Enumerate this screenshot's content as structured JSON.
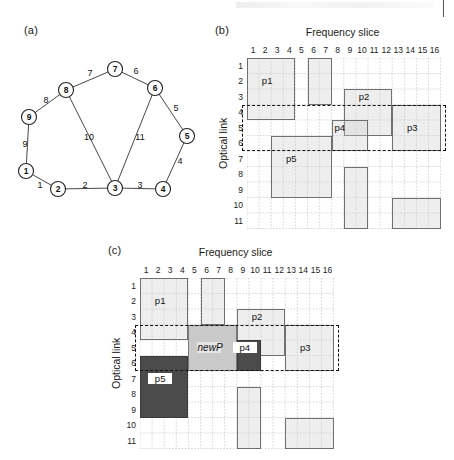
{
  "figure": {
    "panels": {
      "a": "(a)",
      "b": "(b)",
      "c": "(c)"
    },
    "axis": {
      "x_title": "Frequency slice",
      "y_title": "Optical link"
    },
    "columns": [
      "1",
      "2",
      "3",
      "4",
      "5",
      "6",
      "7",
      "8",
      "9",
      "10",
      "11",
      "12",
      "13",
      "14",
      "15",
      "16"
    ],
    "rows": [
      "1",
      "2",
      "3",
      "4",
      "5",
      "6",
      "7",
      "8",
      "9",
      "10",
      "11"
    ]
  },
  "topology": {
    "nodes": [
      {
        "id": "1",
        "label": "1",
        "x": 26,
        "y": 131
      },
      {
        "id": "2",
        "label": "2",
        "x": 58,
        "y": 149
      },
      {
        "id": "3",
        "label": "3",
        "x": 115,
        "y": 148
      },
      {
        "id": "4",
        "label": "4",
        "x": 163,
        "y": 149
      },
      {
        "id": "5",
        "label": "5",
        "x": 187,
        "y": 96
      },
      {
        "id": "6",
        "label": "6",
        "x": 155,
        "y": 48
      },
      {
        "id": "7",
        "label": "7",
        "x": 115,
        "y": 29
      },
      {
        "id": "8",
        "label": "8",
        "x": 66,
        "y": 50
      },
      {
        "id": "9",
        "label": "9",
        "x": 29,
        "y": 77
      }
    ],
    "links": [
      {
        "label": "1",
        "from": "1",
        "to": "2",
        "lx": 40,
        "ly": 146
      },
      {
        "label": "2",
        "from": "2",
        "to": "3",
        "lx": 85,
        "ly": 146
      },
      {
        "label": "3",
        "from": "3",
        "to": "4",
        "lx": 140,
        "ly": 146
      },
      {
        "label": "4",
        "from": "4",
        "to": "5",
        "lx": 180,
        "ly": 122
      },
      {
        "label": "5",
        "from": "5",
        "to": "6",
        "lx": 176,
        "ly": 69
      },
      {
        "label": "6",
        "from": "6",
        "to": "7",
        "lx": 136,
        "ly": 32
      },
      {
        "label": "7",
        "from": "7",
        "to": "8",
        "lx": 90,
        "ly": 34
      },
      {
        "label": "8",
        "from": "8",
        "to": "9",
        "lx": 46,
        "ly": 61
      },
      {
        "label": "9",
        "from": "9",
        "to": "1",
        "lx": 25,
        "ly": 105
      },
      {
        "label": "10",
        "from": "8",
        "to": "3",
        "lx": 89,
        "ly": 98
      },
      {
        "label": "11",
        "from": "6",
        "to": "3",
        "lx": 140,
        "ly": 98
      }
    ]
  },
  "chart_data": {
    "type": "heatmap",
    "xlabel": "Frequency slice",
    "ylabel": "Optical link",
    "x": [
      "1",
      "2",
      "3",
      "4",
      "5",
      "6",
      "7",
      "8",
      "9",
      "10",
      "11",
      "12",
      "13",
      "14",
      "15",
      "16"
    ],
    "y": [
      "1",
      "2",
      "3",
      "4",
      "5",
      "6",
      "7",
      "8",
      "9",
      "10",
      "11"
    ],
    "panels": [
      {
        "key": "b",
        "tag": "(b)",
        "caption": "Spectrum state before allocation",
        "blocks": [
          {
            "label": "p1",
            "col_start": 1,
            "col_end": 4,
            "row_start": 1,
            "row_end": 4,
            "shade": "light",
            "label_col": 2,
            "label_row": 2
          },
          {
            "label": "",
            "col_start": 6,
            "col_end": 7,
            "row_start": 1,
            "row_end": 3,
            "shade": "light",
            "label_col": 0,
            "label_row": 0
          },
          {
            "label": "p2",
            "col_start": 9,
            "col_end": 12,
            "row_start": 3,
            "row_end": 5,
            "shade": "light",
            "label_col": 10,
            "label_row": 3
          },
          {
            "label": "p3",
            "col_start": 13,
            "col_end": 16,
            "row_start": 4,
            "row_end": 6,
            "shade": "light",
            "label_col": 14,
            "label_row": 5
          },
          {
            "label": "p4",
            "col_start": 8,
            "col_end": 10,
            "row_start": 5,
            "row_end": 6,
            "shade": "light",
            "label_col": 8,
            "label_row": 5
          },
          {
            "label": "p5",
            "col_start": 3,
            "col_end": 7,
            "row_start": 6,
            "row_end": 9,
            "shade": "light",
            "label_col": 4,
            "label_row": 7
          },
          {
            "label": "",
            "col_start": 9,
            "col_end": 10,
            "row_start": 8,
            "row_end": 11,
            "shade": "light",
            "label_col": 0,
            "label_row": 0
          },
          {
            "label": "",
            "col_start": 13,
            "col_end": 16,
            "row_start": 10,
            "row_end": 11,
            "shade": "light",
            "label_col": 0,
            "label_row": 0
          }
        ],
        "dashed_region": {
          "row_start": 4,
          "row_end": 6,
          "col_start": 1,
          "col_end": 16
        }
      },
      {
        "key": "c",
        "tag": "(c)",
        "caption": "Spectrum state after allocating newP",
        "blocks": [
          {
            "label": "p1",
            "col_start": 1,
            "col_end": 4,
            "row_start": 1,
            "row_end": 4,
            "shade": "light",
            "label_col": 2,
            "label_row": 2
          },
          {
            "label": "",
            "col_start": 6,
            "col_end": 7,
            "row_start": 1,
            "row_end": 3,
            "shade": "light",
            "label_col": 0,
            "label_row": 0
          },
          {
            "label": "p2",
            "col_start": 9,
            "col_end": 12,
            "row_start": 3,
            "row_end": 5,
            "shade": "light",
            "label_col": 10,
            "label_row": 3
          },
          {
            "label": "p3",
            "col_start": 13,
            "col_end": 16,
            "row_start": 4,
            "row_end": 6,
            "shade": "light",
            "label_col": 14,
            "label_row": 5
          },
          {
            "label": "newP",
            "col_start": 5,
            "col_end": 8,
            "row_start": 4,
            "row_end": 6,
            "shade": "mid",
            "label_col": 6,
            "label_row": 5
          },
          {
            "label": "p4",
            "col_start": 9,
            "col_end": 10,
            "row_start": 5,
            "row_end": 6,
            "shade": "dark",
            "label_col": 9,
            "label_row": 5
          },
          {
            "label": "p5",
            "col_start": 1,
            "col_end": 4,
            "row_start": 6,
            "row_end": 9,
            "shade": "dark",
            "label_col": 2,
            "label_row": 7
          },
          {
            "label": "",
            "col_start": 9,
            "col_end": 10,
            "row_start": 8,
            "row_end": 11,
            "shade": "light",
            "label_col": 0,
            "label_row": 0
          },
          {
            "label": "",
            "col_start": 13,
            "col_end": 16,
            "row_start": 10,
            "row_end": 11,
            "shade": "light",
            "label_col": 0,
            "label_row": 0
          }
        ],
        "dashed_region": {
          "row_start": 4,
          "row_end": 6,
          "col_start": 1,
          "col_end": 16
        }
      }
    ]
  }
}
